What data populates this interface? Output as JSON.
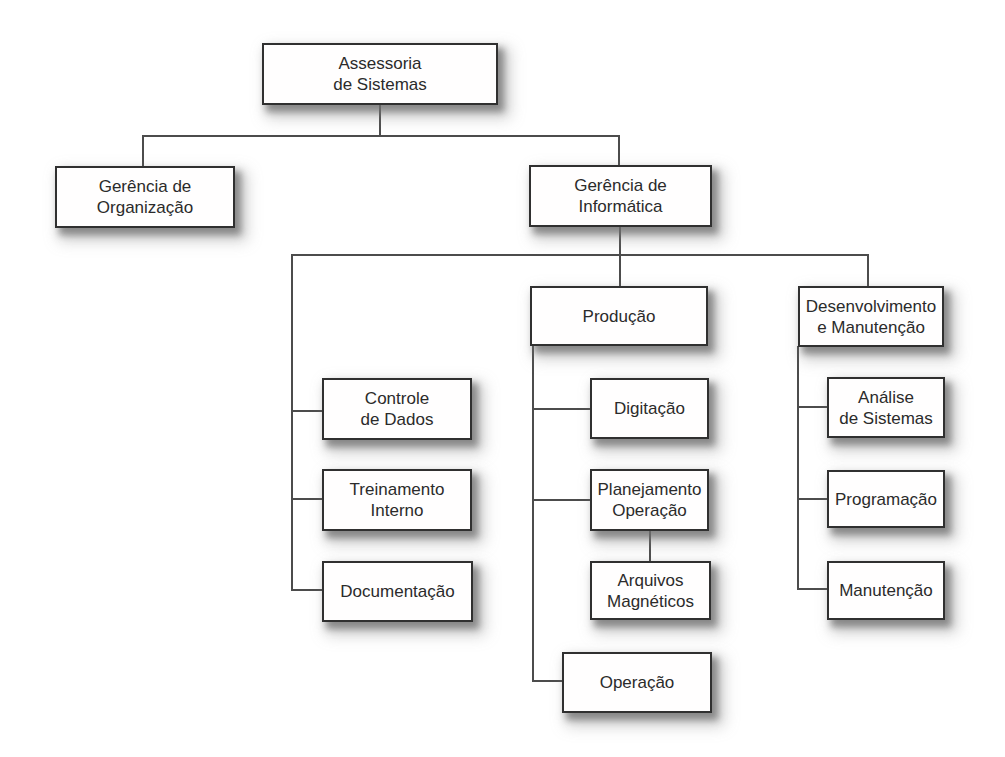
{
  "org": {
    "type": "org-chart",
    "colors": {
      "background": "#ffffff",
      "box_fill": "#fffefe",
      "box_border": "#303030",
      "connector_line": "#4c4c4c",
      "text": "#2b2b2b",
      "shadow": "#8c8c8c"
    },
    "nodes": {
      "assessoria": {
        "label": "Assessoria de Sistemas",
        "lines": [
          "Assessoria",
          "de Sistemas"
        ],
        "parent": null
      },
      "gerencia_organizacao": {
        "label": "Gerência de Organização",
        "lines": [
          "Gerência de",
          "Organização"
        ],
        "parent": "Assessoria de Sistemas"
      },
      "gerencia_informatica": {
        "label": "Gerência de Informática",
        "lines": [
          "Gerência de",
          "Informática"
        ],
        "parent": "Assessoria de Sistemas"
      },
      "controle_dados": {
        "label": "Controle de Dados",
        "lines": [
          "Controle",
          "de Dados"
        ],
        "parent": "Gerência de Informática"
      },
      "treinamento_interno": {
        "label": "Treinamento Interno",
        "lines": [
          "Treinamento",
          "Interno"
        ],
        "parent": "Gerência de Informática"
      },
      "documentacao": {
        "label": "Documentação",
        "lines": [
          "Documentação"
        ],
        "parent": "Gerência de Informática"
      },
      "producao": {
        "label": "Produção",
        "lines": [
          "Produção"
        ],
        "parent": "Gerência de Informática"
      },
      "digitacao": {
        "label": "Digitação",
        "lines": [
          "Digitação"
        ],
        "parent": "Produção"
      },
      "planejamento_operacao": {
        "label": "Planejamento Operação",
        "lines": [
          "Planejamento",
          "Operação"
        ],
        "parent": "Produção"
      },
      "arquivos_magneticos": {
        "label": "Arquivos Magnéticos",
        "lines": [
          "Arquivos",
          "Magnéticos"
        ],
        "parent": "Planejamento Operação"
      },
      "operacao": {
        "label": "Operação",
        "lines": [
          "Operação"
        ],
        "parent": "Produção"
      },
      "desenvolvimento_manutencao": {
        "label": "Desenvolvimento e Manutenção",
        "lines": [
          "Desenvolvimento",
          "e Manutenção"
        ],
        "parent": "Gerência de Informática"
      },
      "analise_sistemas": {
        "label": "Análise de Sistemas",
        "lines": [
          "Análise",
          "de Sistemas"
        ],
        "parent": "Desenvolvimento e Manutenção"
      },
      "programacao": {
        "label": "Programação",
        "lines": [
          "Programação"
        ],
        "parent": "Desenvolvimento e Manutenção"
      },
      "manutencao": {
        "label": "Manutenção",
        "lines": [
          "Manutenção"
        ],
        "parent": "Desenvolvimento e Manutenção"
      }
    }
  }
}
